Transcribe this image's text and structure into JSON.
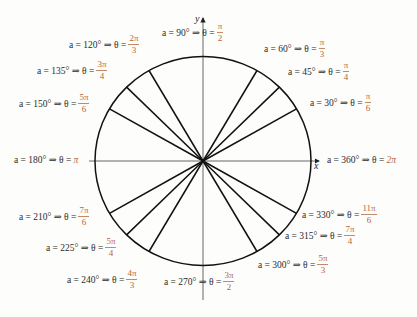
{
  "diagram": {
    "colors": {
      "text": "#2b2b2b",
      "accent": "#b5653a",
      "lines": "#111111",
      "axes": "#444444",
      "background": "#fdfdfb"
    },
    "geometry": {
      "center": [
        203,
        161
      ],
      "rx": 108,
      "ry": 104.5
    },
    "axes": {
      "x_label": "x",
      "y_label": "y"
    },
    "labels": [
      {
        "id": "a0",
        "deg": "90°",
        "prefix": "a = 90° ⇒ θ =",
        "num": "π",
        "den": "2",
        "x": 162,
        "y": 30
      },
      {
        "id": "a1",
        "deg": "60°",
        "prefix": "a = 60° ⇒ θ =",
        "num": "π",
        "den": "3",
        "x": 264,
        "y": 46
      },
      {
        "id": "a2",
        "deg": "45°",
        "prefix": "a = 45° ⇒ θ =",
        "num": "π",
        "den": "4",
        "x": 288,
        "y": 69
      },
      {
        "id": "a3",
        "deg": "30°",
        "prefix": "a = 30° ⇒ θ =",
        "num": "π",
        "den": "6",
        "x": 310,
        "y": 100
      },
      {
        "id": "a4",
        "deg": "120°",
        "prefix": "a = 120° ⇒ θ =",
        "num": "2π",
        "den": "3",
        "x": 69,
        "y": 42
      },
      {
        "id": "a5",
        "deg": "135°",
        "prefix": "a = 135° ⇒ θ =",
        "num": "3π",
        "den": "4",
        "x": 37,
        "y": 68
      },
      {
        "id": "a6",
        "deg": "150°",
        "prefix": "a = 150° ⇒ θ =",
        "num": "5π",
        "den": "6",
        "x": 19,
        "y": 101
      },
      {
        "id": "a7",
        "deg": "210°",
        "prefix": "a = 210° ⇒ θ =",
        "num": "7π",
        "den": "6",
        "x": 19,
        "y": 214
      },
      {
        "id": "a8",
        "deg": "225°",
        "prefix": "a = 225° ⇒ θ =",
        "num": "5π",
        "den": "4",
        "x": 46,
        "y": 245
      },
      {
        "id": "a9",
        "deg": "240°",
        "prefix": "a = 240° ⇒ θ =",
        "num": "4π",
        "den": "3",
        "x": 67,
        "y": 277
      },
      {
        "id": "a10",
        "deg": "270°",
        "prefix": "a = 270° ⇒ θ =",
        "num": "3π",
        "den": "2",
        "x": 164,
        "y": 279
      },
      {
        "id": "a11",
        "deg": "300°",
        "prefix": "a = 300° ⇒ θ =",
        "num": "5π",
        "den": "3",
        "x": 258,
        "y": 262
      },
      {
        "id": "a12",
        "deg": "315°",
        "prefix": "a = 315° ⇒ θ =",
        "num": "7π",
        "den": "4",
        "x": 285,
        "y": 233
      },
      {
        "id": "a13",
        "deg": "330°",
        "prefix": "a = 330° ⇒ θ =",
        "num": "11π",
        "den": "6",
        "x": 302,
        "y": 212
      }
    ],
    "inline_labels": [
      {
        "id": "a180",
        "deg": "180°",
        "prefix": "a = 180° ⇒ θ =",
        "value": "π",
        "x": 14,
        "y": 155
      },
      {
        "id": "a360",
        "deg": "360°",
        "prefix": "a = 360° ⇒ θ =",
        "value": "2π",
        "x": 327,
        "y": 155
      }
    ],
    "radial_angles_deg": [
      30,
      45,
      60,
      120,
      135,
      150,
      210,
      225,
      240,
      300,
      315,
      330
    ]
  }
}
